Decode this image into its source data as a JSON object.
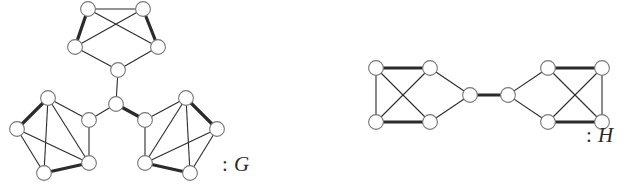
{
  "figure": {
    "background_color": "#ffffff",
    "node_fill": "#ffffff",
    "node_stroke": "#777777",
    "edge_color": "#2b2b2b",
    "thin_width": 1.1,
    "thick_width": 3.2,
    "node_radius": 7.4
  },
  "labels": {
    "graph_g": {
      "colon": ":",
      "name": "G"
    },
    "graph_h": {
      "colon": ":",
      "name": "H"
    }
  },
  "graphs": [
    {
      "id": "G",
      "label": "G",
      "description": "Three 5-vertex petal clusters joined to a central hub vertex",
      "nodes": [
        {
          "id": "t1",
          "x": 88,
          "y": 9
        },
        {
          "id": "t2",
          "x": 143,
          "y": 9
        },
        {
          "id": "t3",
          "x": 75,
          "y": 47
        },
        {
          "id": "t4",
          "x": 158,
          "y": 47
        },
        {
          "id": "t5",
          "x": 118,
          "y": 70
        },
        {
          "id": "hub",
          "x": 116,
          "y": 104
        },
        {
          "id": "l1",
          "x": 48,
          "y": 98
        },
        {
          "id": "l2",
          "x": 17,
          "y": 129
        },
        {
          "id": "l3",
          "x": 44,
          "y": 173
        },
        {
          "id": "l4",
          "x": 89,
          "y": 163
        },
        {
          "id": "l5",
          "x": 89,
          "y": 120
        },
        {
          "id": "r1",
          "x": 186,
          "y": 98
        },
        {
          "id": "r2",
          "x": 217,
          "y": 129
        },
        {
          "id": "r3",
          "x": 190,
          "y": 173
        },
        {
          "id": "r4",
          "x": 145,
          "y": 163
        },
        {
          "id": "r5",
          "x": 145,
          "y": 120
        }
      ],
      "edges": [
        {
          "from": "t1",
          "to": "t2",
          "weight": "thin"
        },
        {
          "from": "t1",
          "to": "t3",
          "weight": "thick"
        },
        {
          "from": "t2",
          "to": "t4",
          "weight": "thick"
        },
        {
          "from": "t1",
          "to": "t4",
          "weight": "thin"
        },
        {
          "from": "t2",
          "to": "t3",
          "weight": "thin"
        },
        {
          "from": "t3",
          "to": "t5",
          "weight": "thin"
        },
        {
          "from": "t4",
          "to": "t5",
          "weight": "thin"
        },
        {
          "from": "t5",
          "to": "hub",
          "weight": "thin"
        },
        {
          "from": "l1",
          "to": "l2",
          "weight": "thick"
        },
        {
          "from": "l1",
          "to": "l5",
          "weight": "thin"
        },
        {
          "from": "l1",
          "to": "l4",
          "weight": "thin"
        },
        {
          "from": "l1",
          "to": "l3",
          "weight": "thin"
        },
        {
          "from": "l2",
          "to": "l3",
          "weight": "thin"
        },
        {
          "from": "l2",
          "to": "l4",
          "weight": "thin"
        },
        {
          "from": "l3",
          "to": "l4",
          "weight": "thick"
        },
        {
          "from": "l4",
          "to": "l5",
          "weight": "thin"
        },
        {
          "from": "l5",
          "to": "hub",
          "weight": "thin"
        },
        {
          "from": "r1",
          "to": "r2",
          "weight": "thick"
        },
        {
          "from": "r1",
          "to": "r5",
          "weight": "thin"
        },
        {
          "from": "r1",
          "to": "r4",
          "weight": "thin"
        },
        {
          "from": "r1",
          "to": "r3",
          "weight": "thin"
        },
        {
          "from": "r2",
          "to": "r3",
          "weight": "thin"
        },
        {
          "from": "r2",
          "to": "r4",
          "weight": "thin"
        },
        {
          "from": "r3",
          "to": "r4",
          "weight": "thick"
        },
        {
          "from": "r4",
          "to": "r5",
          "weight": "thin"
        },
        {
          "from": "r5",
          "to": "hub",
          "weight": "thick"
        }
      ]
    },
    {
      "id": "H",
      "label": "H",
      "description": "Two K4 blocks joined through a pair of bridge vertices",
      "nodes": [
        {
          "id": "a1",
          "x": 376,
          "y": 68
        },
        {
          "id": "a2",
          "x": 430,
          "y": 68
        },
        {
          "id": "a3",
          "x": 376,
          "y": 122
        },
        {
          "id": "a4",
          "x": 430,
          "y": 122
        },
        {
          "id": "m1",
          "x": 470,
          "y": 95
        },
        {
          "id": "m2",
          "x": 508,
          "y": 95
        },
        {
          "id": "b1",
          "x": 548,
          "y": 68
        },
        {
          "id": "b2",
          "x": 602,
          "y": 68
        },
        {
          "id": "b3",
          "x": 548,
          "y": 122
        },
        {
          "id": "b4",
          "x": 602,
          "y": 122
        }
      ],
      "edges": [
        {
          "from": "a1",
          "to": "a2",
          "weight": "thick"
        },
        {
          "from": "a3",
          "to": "a4",
          "weight": "thick"
        },
        {
          "from": "a1",
          "to": "a3",
          "weight": "thin"
        },
        {
          "from": "a1",
          "to": "a4",
          "weight": "thin"
        },
        {
          "from": "a2",
          "to": "a3",
          "weight": "thin"
        },
        {
          "from": "a2",
          "to": "m1",
          "weight": "thin"
        },
        {
          "from": "a4",
          "to": "m1",
          "weight": "thin"
        },
        {
          "from": "m1",
          "to": "m2",
          "weight": "thick"
        },
        {
          "from": "m2",
          "to": "b1",
          "weight": "thin"
        },
        {
          "from": "m2",
          "to": "b3",
          "weight": "thin"
        },
        {
          "from": "b1",
          "to": "b2",
          "weight": "thick"
        },
        {
          "from": "b3",
          "to": "b4",
          "weight": "thick"
        },
        {
          "from": "b2",
          "to": "b4",
          "weight": "thin"
        },
        {
          "from": "b1",
          "to": "b4",
          "weight": "thin"
        },
        {
          "from": "b2",
          "to": "b3",
          "weight": "thin"
        }
      ]
    }
  ]
}
